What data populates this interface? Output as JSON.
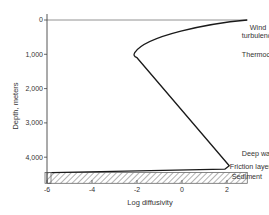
{
  "chart_data": {
    "type": "line",
    "title": "",
    "xlabel": "Log diffusivity",
    "ylabel": "Depth, meters",
    "xlim": [
      -6,
      3
    ],
    "ylim": [
      4800,
      0
    ],
    "y_inverted": true,
    "grid": false,
    "legend": "none",
    "x_ticks": [
      -6,
      -4,
      -2,
      0,
      2
    ],
    "x_tick_labels": [
      "-6",
      "-4",
      "-2",
      "0",
      "2"
    ],
    "y_ticks": [
      0,
      1000,
      2000,
      3000,
      4000
    ],
    "y_tick_labels": [
      "0",
      "1,000",
      "2,000",
      "3,000",
      "4,000"
    ],
    "series": [
      {
        "name": "Diffusivity profile",
        "x": [
          2.9,
          0.5,
          -1.5,
          -2.1,
          -2.0,
          2.1,
          1.9,
          -5.8
        ],
        "y": [
          0,
          250,
          650,
          950,
          1100,
          4250,
          4350,
          4450
        ]
      }
    ],
    "annotations": [
      {
        "text_lines": [
          "Wind",
          "turbulence"
        ],
        "x": 2.3,
        "y": 380
      },
      {
        "text": "Thermocline",
        "x": 2.3,
        "y": 1000
      },
      {
        "text": "Deep water",
        "x": 2.3,
        "y": 3900
      },
      {
        "text": "Friction layer",
        "x": 2.3,
        "y": 4260
      },
      {
        "text": "Sediment",
        "x": 2.3,
        "y": 4560
      }
    ],
    "regions": [
      {
        "name": "Sediment",
        "style": "hatched",
        "y_range": [
          4450,
          4760
        ],
        "x_range": [
          -6,
          2.9
        ]
      }
    ],
    "reference_lines": [
      {
        "name": "surface",
        "y": 0,
        "x_range": [
          -6,
          2.9
        ]
      }
    ]
  },
  "colors": {
    "line": "#1a1a1a",
    "axis": "#444444",
    "surface_line": "#777777",
    "hatch": "#555555",
    "background": "#ffffff"
  }
}
